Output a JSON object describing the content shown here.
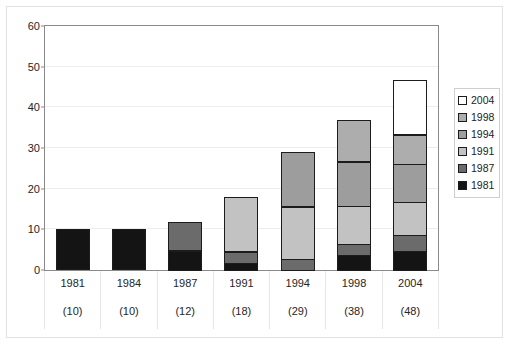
{
  "chart_data": {
    "type": "bar",
    "stacked": true,
    "title": "",
    "subtitle": "",
    "xlabel": "",
    "ylabel": "",
    "ylim": [
      0,
      60
    ],
    "ytick_step": 10,
    "yticks": [
      "0",
      "10",
      "20",
      "30",
      "40",
      "50",
      "60"
    ],
    "grid": true,
    "legend_position": "right",
    "categories": [
      "1981",
      "1984",
      "1987",
      "1991",
      "1994",
      "1998",
      "2004"
    ],
    "category_sublabels": [
      "(10)",
      "(10)",
      "(12)",
      "(18)",
      "(29)",
      "(38)",
      "(48)"
    ],
    "series": [
      {
        "name": "1981",
        "color": "#141414",
        "values": [
          10,
          10,
          5,
          2,
          0,
          4,
          5
        ]
      },
      {
        "name": "1987",
        "color": "#6b6b6b",
        "values": [
          0,
          0,
          7,
          3,
          3,
          3,
          4
        ]
      },
      {
        "name": "1991",
        "color": "#c2c2c2",
        "values": [
          0,
          0,
          0,
          13.5,
          13,
          9.5,
          8.5
        ]
      },
      {
        "name": "1994",
        "color": "#9d9d9d",
        "values": [
          0,
          0,
          0,
          0,
          13.5,
          11,
          9.5
        ]
      },
      {
        "name": "1998",
        "color": "#adadad",
        "values": [
          0,
          0,
          0,
          0,
          0,
          10.5,
          7.5
        ]
      },
      {
        "name": "2004",
        "color": "#ffffff",
        "values": [
          0,
          0,
          0,
          0,
          0,
          0,
          13.5
        ]
      }
    ],
    "totals": [
      10,
      10,
      12,
      18.5,
      29.5,
      38,
      48
    ],
    "legend_order": [
      "2004",
      "1998",
      "1994",
      "1991",
      "1987",
      "1981"
    ]
  },
  "legend": {
    "items": [
      {
        "label": "2004",
        "color": "#ffffff"
      },
      {
        "label": "1998",
        "color": "#adadad"
      },
      {
        "label": "1994",
        "color": "#9d9d9d"
      },
      {
        "label": "1991",
        "color": "#c2c2c2"
      },
      {
        "label": "1987",
        "color": "#6b6b6b"
      },
      {
        "label": "1981",
        "color": "#141414"
      }
    ]
  },
  "artifact": {
    "top_glyph": "°"
  }
}
